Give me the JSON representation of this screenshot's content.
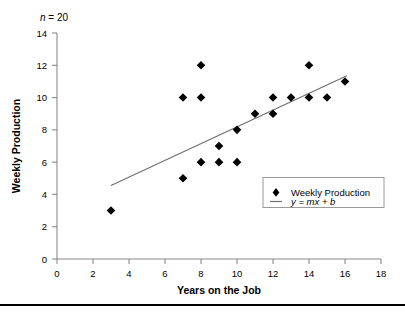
{
  "chart_data": {
    "type": "scatter",
    "title": "",
    "xlabel": "Years on the Job",
    "ylabel": "Weekly Production",
    "xlim": [
      0,
      18
    ],
    "ylim": [
      0,
      14
    ],
    "xticks": [
      0,
      2,
      4,
      6,
      8,
      10,
      12,
      14,
      16,
      18
    ],
    "yticks": [
      0,
      2,
      4,
      6,
      8,
      10,
      12,
      14
    ],
    "grid": false,
    "legend_position": "lower right",
    "annotation": "n = 20",
    "annotation_parts": {
      "symbol": "n",
      "equals": " = 20"
    },
    "series": [
      {
        "name": "Weekly Production",
        "type": "scatter",
        "marker": "diamond",
        "color": "#000000",
        "points": [
          {
            "x": 3,
            "y": 3
          },
          {
            "x": 7,
            "y": 5
          },
          {
            "x": 7,
            "y": 10
          },
          {
            "x": 8,
            "y": 6
          },
          {
            "x": 8,
            "y": 10
          },
          {
            "x": 8,
            "y": 12
          },
          {
            "x": 9,
            "y": 6
          },
          {
            "x": 9,
            "y": 7
          },
          {
            "x": 10,
            "y": 6
          },
          {
            "x": 10,
            "y": 8
          },
          {
            "x": 11,
            "y": 9
          },
          {
            "x": 12,
            "y": 9
          },
          {
            "x": 12,
            "y": 10
          },
          {
            "x": 13,
            "y": 10
          },
          {
            "x": 14,
            "y": 10
          },
          {
            "x": 14,
            "y": 12
          },
          {
            "x": 15,
            "y": 10
          },
          {
            "x": 16,
            "y": 11
          },
          {
            "x": 13,
            "y": 10
          },
          {
            "x": 11,
            "y": 9
          }
        ]
      },
      {
        "name": "y = mx + b",
        "type": "line",
        "color": "#6d6d6d",
        "endpoints": [
          {
            "x": 3.0,
            "y": 4.55
          },
          {
            "x": 16.1,
            "y": 11.35
          }
        ]
      }
    ],
    "legend": [
      {
        "label": "Weekly Production",
        "marker": "diamond",
        "color": "#000000"
      },
      {
        "label": "y = mx + b",
        "marker": "line",
        "color": "#6d6d6d"
      }
    ]
  },
  "legend": {
    "item1_label": "Weekly Production",
    "item2_label": "y = mx + b"
  },
  "axes": {
    "x_title": "Years on the Job",
    "y_title": "Weekly Production",
    "x_tick_labels": [
      "0",
      "2",
      "4",
      "6",
      "8",
      "10",
      "12",
      "14",
      "16",
      "18"
    ],
    "y_tick_labels": [
      "0",
      "2",
      "4",
      "6",
      "8",
      "10",
      "12",
      "14"
    ]
  },
  "annotation": {
    "text": "n = 20"
  },
  "colors": {
    "marker": "#000000",
    "line": "#6d6d6d",
    "axis": "#8a8a8a",
    "rule": "#000000"
  }
}
